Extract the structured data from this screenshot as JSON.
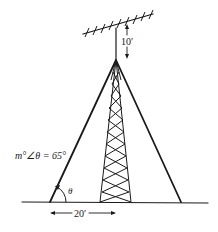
{
  "diagram": {
    "type": "geometry-figure",
    "labels": {
      "antenna_height": "10′",
      "angle_measure": "m°∠θ = 65°",
      "angle_symbol": "θ",
      "base_distance": "20′"
    },
    "colors": {
      "line": "#1a1a1a",
      "background": "#ffffff"
    }
  }
}
